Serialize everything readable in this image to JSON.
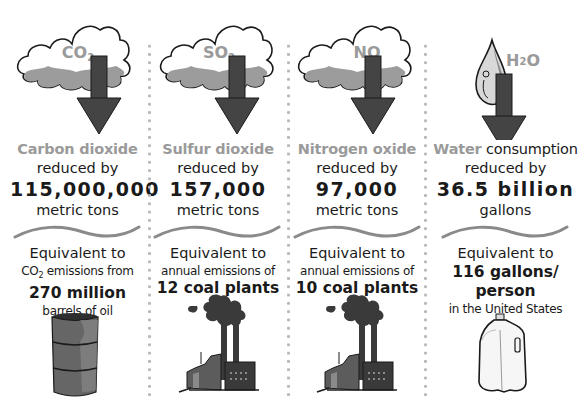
{
  "columns": [
    {
      "icon": "cloud-co2-down-arrow-icon",
      "cloud_label": "CO",
      "cloud_sub": "2",
      "gas_name": "Carbon dioxide",
      "gas_suffix": "",
      "reduced_label": "reduced by",
      "amount": "115,000,000",
      "unit": "metric tons",
      "equivalent_label": "Equivalent to",
      "detail_prefix": "CO",
      "detail_sub": "2",
      "detail_text": " emissions from",
      "equivalent_value": "270 million",
      "equivalent_unit": "barrels of oil",
      "bottom_icon": "oil-barrel-icon"
    },
    {
      "icon": "cloud-so2-down-arrow-icon",
      "cloud_label": "SO",
      "cloud_sub": "2",
      "gas_name": "Sulfur dioxide",
      "reduced_label": "reduced by",
      "amount": "157,000",
      "unit": "metric tons",
      "equivalent_label": "Equivalent to",
      "detail_text": "annual emissions of",
      "equivalent_value": "12 coal plants",
      "bottom_icon": "coal-plant-icon"
    },
    {
      "icon": "cloud-no-down-arrow-icon",
      "cloud_label": "NO",
      "gas_name": "Nitrogen oxide",
      "reduced_label": "reduced by",
      "amount": "97,000",
      "unit": "metric tons",
      "equivalent_label": "Equivalent to",
      "detail_text": "annual emissions of",
      "equivalent_value": "10 coal plants",
      "bottom_icon": "coal-plant-icon"
    },
    {
      "icon": "water-drop-down-arrow-icon",
      "drop_label": "H",
      "drop_sub": "2",
      "drop_label_end": "O",
      "gas_name": "Water",
      "gas_suffix": " consumption",
      "reduced_label": "reduced by",
      "amount": "36.5 billion",
      "unit": "gallons",
      "equivalent_label": "Equivalent to",
      "equivalent_value_line1": "116 gallons/",
      "equivalent_value_line2": "person",
      "detail_text": "in the United States",
      "bottom_icon": "milk-jug-icon"
    }
  ],
  "colors": {
    "gas_label": "#9a9a9a",
    "cloud_shadow": "#9c9c9c",
    "arrow": "#444444",
    "wave": "#8a8a8a",
    "divider_dots": "#b8b8b8"
  }
}
